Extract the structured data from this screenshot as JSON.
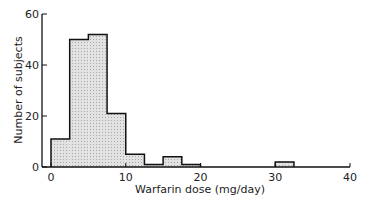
{
  "chart_data": {
    "type": "bar",
    "title": "",
    "xlabel": "Warfarin dose (mg/day)",
    "ylabel": "Number of subjects",
    "xlim": [
      0,
      40
    ],
    "ylim": [
      0,
      60
    ],
    "bin_width": 2.5,
    "bins": [
      {
        "x0": 0,
        "x1": 2.5,
        "count": 11
      },
      {
        "x0": 2.5,
        "x1": 5,
        "count": 50
      },
      {
        "x0": 5,
        "x1": 7.5,
        "count": 52
      },
      {
        "x0": 7.5,
        "x1": 10,
        "count": 21
      },
      {
        "x0": 10,
        "x1": 12.5,
        "count": 5
      },
      {
        "x0": 12.5,
        "x1": 15,
        "count": 1
      },
      {
        "x0": 15,
        "x1": 17.5,
        "count": 4
      },
      {
        "x0": 17.5,
        "x1": 20,
        "count": 1
      },
      {
        "x0": 30,
        "x1": 32.5,
        "count": 2
      }
    ],
    "x_ticks": [
      "0",
      "10",
      "20",
      "30",
      "40"
    ],
    "y_ticks": [
      "0",
      "20",
      "40",
      "60"
    ],
    "grid": false,
    "legend": null
  }
}
